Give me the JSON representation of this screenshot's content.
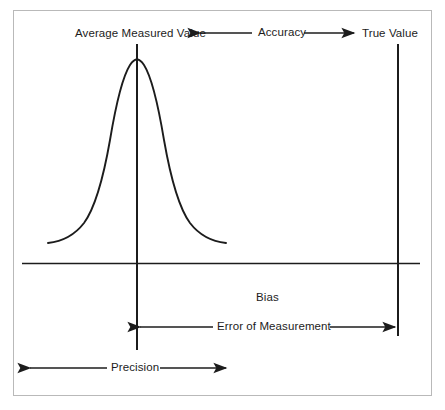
{
  "diagram": {
    "type": "annotated-normal-distribution-diagram",
    "labels": {
      "average_measured_value": "Average Measured Value",
      "accuracy": "Accuracy",
      "true_value": "True Value",
      "bias": "Bias",
      "error_of_measurement": "Error of Measurement",
      "precision": "Precision"
    },
    "colors": {
      "ink": "#1c1c1c",
      "frame": "#b9b9b9",
      "background": "#ffffff"
    },
    "annotations": [
      {
        "name": "accuracy-arrow",
        "text": "Accuracy",
        "arrowheads": "both",
        "from_label": "Average Measured Value",
        "to_label": "True Value"
      },
      {
        "name": "bias-label",
        "text": "Bias",
        "arrowheads": "none"
      },
      {
        "name": "error-of-measurement-arrow",
        "text": "Error of Measurement",
        "arrowheads": "both",
        "from": "average-measured-value-line",
        "to": "true-value-line"
      },
      {
        "name": "precision-arrow",
        "text": "Precision",
        "arrowheads": "both",
        "spans": "distribution-spread"
      }
    ],
    "curve": {
      "shape": "bell",
      "peak_label": "Average Measured Value",
      "peak_x": 137,
      "baseline_y": 263
    },
    "reference_lines": [
      {
        "name": "average-measured-value-line",
        "x": 137,
        "orientation": "vertical"
      },
      {
        "name": "true-value-line",
        "x": 398,
        "orientation": "vertical"
      },
      {
        "name": "baseline",
        "y": 263,
        "orientation": "horizontal"
      }
    ]
  }
}
